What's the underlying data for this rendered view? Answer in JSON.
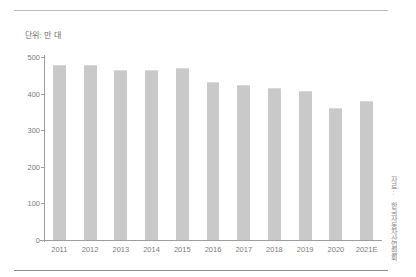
{
  "figure": {
    "unit_label": "단위: 만 대",
    "source_note": "자료: 한국자동차산업협회"
  },
  "chart_data": {
    "type": "bar",
    "title": "",
    "subtitle": "",
    "xlabel": "",
    "ylabel": "단위: 만 대",
    "categories": [
      "2011",
      "2012",
      "2013",
      "2014",
      "2015",
      "2016",
      "2017",
      "2018",
      "2019",
      "2020",
      "2021E"
    ],
    "values": [
      475,
      476,
      463,
      462,
      466,
      429,
      421,
      412,
      405,
      358,
      378
    ],
    "ylim": [
      0,
      500
    ],
    "yticks": [
      0,
      100,
      200,
      300,
      400,
      500
    ],
    "ytick_labels": [
      "0",
      "100",
      "200",
      "300",
      "400",
      "500"
    ],
    "grid": false,
    "legend": "none",
    "bar_color": "#c9c9c9",
    "axis_color": "#9e9e9e",
    "tick_text_color": "#7a7a7a"
  }
}
